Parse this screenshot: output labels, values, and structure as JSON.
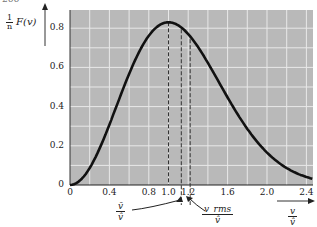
{
  "page": {
    "number_fragment": "266"
  },
  "y_axis_label": {
    "prefix_num": "1",
    "prefix_den": "n",
    "text": "F(v)"
  },
  "chart_data": {
    "type": "line",
    "title": "",
    "xlabel": "v / v̂",
    "ylabel": "(1/n) F(v)",
    "xlim": [
      0,
      2.55
    ],
    "ylim": [
      0,
      0.9
    ],
    "grid": true,
    "x_ticks": [
      "0",
      "0.4",
      "0.8",
      "1.0",
      "1.2",
      "1.6",
      "2.0",
      "2.4"
    ],
    "y_ticks": [
      "0",
      "0.2",
      "0.4",
      "0.6",
      "0.8"
    ],
    "series": [
      {
        "name": "Maxwell speed distribution",
        "x": [
          0,
          0.1,
          0.2,
          0.3,
          0.4,
          0.5,
          0.6,
          0.7,
          0.8,
          0.9,
          1.0,
          1.1,
          1.2,
          1.3,
          1.4,
          1.5,
          1.6,
          1.7,
          1.8,
          1.9,
          2.0,
          2.1,
          2.2,
          2.3,
          2.4,
          2.5
        ],
        "values": [
          0,
          0.022,
          0.087,
          0.186,
          0.307,
          0.44,
          0.569,
          0.681,
          0.765,
          0.815,
          0.83,
          0.81,
          0.759,
          0.684,
          0.592,
          0.496,
          0.398,
          0.31,
          0.234,
          0.17,
          0.12,
          0.081,
          0.053,
          0.034,
          0.02,
          0.012
        ]
      }
    ],
    "markers": [
      {
        "label": "peak (v̂/v̂)",
        "x": 1.0,
        "style": "dashed"
      },
      {
        "label": "v̄/v̂",
        "x": 1.13,
        "style": "dashed"
      },
      {
        "label": "v_rms/v̂",
        "x": 1.22,
        "style": "dashed"
      }
    ],
    "annotations": [
      {
        "text_num": "v̄",
        "text_den": "v̂",
        "points_to": 1.13
      },
      {
        "text_num": "v_rms",
        "text_den": "v̂",
        "points_to": 1.22
      }
    ]
  },
  "x_axis_label": {
    "num": "v",
    "den": "v̂"
  },
  "colors": {
    "plot_bg": "#b9b9b9",
    "grid": "#e8e8e8",
    "curve": "#111111"
  }
}
